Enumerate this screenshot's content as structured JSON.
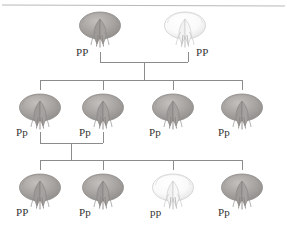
{
  "diagram": {
    "type": "pedigree",
    "colors": {
      "line": "#8c8c8c",
      "rule": "#b9b9b9",
      "text": "#333333",
      "purple_flower_fill": "#a9a6a4",
      "purple_flower_edge": "#8e8b89",
      "white_flower_fill": "#fbfbfb",
      "white_flower_edge": "#cfcfcf",
      "background": "#ffffff"
    },
    "top_rule": {
      "present": true,
      "y": 5
    }
  },
  "generations": [
    {
      "name": "parental",
      "row": 1,
      "y_flower": 10,
      "y_label": 50,
      "individuals": [
        {
          "genotype": "PP",
          "phenotype": "purple",
          "x": 100,
          "label_x": 76,
          "flower_x": 76
        },
        {
          "genotype": "PP",
          "phenotype": "white",
          "x": 188,
          "label_x": 196,
          "flower_x": 161
        }
      ]
    },
    {
      "name": "f1",
      "row": 2,
      "y_flower": 92,
      "y_label": 130,
      "individuals": [
        {
          "genotype": "Pp",
          "phenotype": "purple",
          "x": 40,
          "label_x": 16,
          "flower_x": 16
        },
        {
          "genotype": "Pp",
          "phenotype": "purple",
          "x": 103,
          "label_x": 79,
          "flower_x": 79
        },
        {
          "genotype": "Pp",
          "phenotype": "purple",
          "x": 173,
          "label_x": 149,
          "flower_x": 149
        },
        {
          "genotype": "Pp",
          "phenotype": "purple",
          "x": 242,
          "label_x": 218,
          "flower_x": 218
        }
      ]
    },
    {
      "name": "f2",
      "row": 3,
      "y_flower": 172,
      "y_label": 208,
      "individuals": [
        {
          "genotype": "PP",
          "phenotype": "purple",
          "x": 40,
          "label_x": 16,
          "flower_x": 16
        },
        {
          "genotype": "Pp",
          "phenotype": "purple",
          "x": 103,
          "label_x": 79,
          "flower_x": 79
        },
        {
          "genotype": "pp",
          "phenotype": "white",
          "x": 173,
          "label_x": 150,
          "flower_x": 149
        },
        {
          "genotype": "Pp",
          "phenotype": "purple",
          "x": 242,
          "label_x": 218,
          "flower_x": 218
        }
      ]
    }
  ],
  "crosses": [
    {
      "name": "parental-cross",
      "parent_left_x": 100,
      "parent_right_x": 188,
      "drop_top_y": 52,
      "mating_bar_y": 62,
      "descent_x": 144,
      "sibship_bar_y": 80,
      "children_x": [
        40,
        103,
        173,
        242
      ],
      "child_drop_bottom_y": 90
    },
    {
      "name": "f1-cross",
      "parent_left_x": 40,
      "parent_right_x": 103,
      "drop_top_y": 132,
      "mating_bar_y": 143,
      "descent_x": 71,
      "sibship_bar_y": 160,
      "children_x": [
        40,
        103,
        173,
        242
      ],
      "child_drop_bottom_y": 170
    }
  ]
}
